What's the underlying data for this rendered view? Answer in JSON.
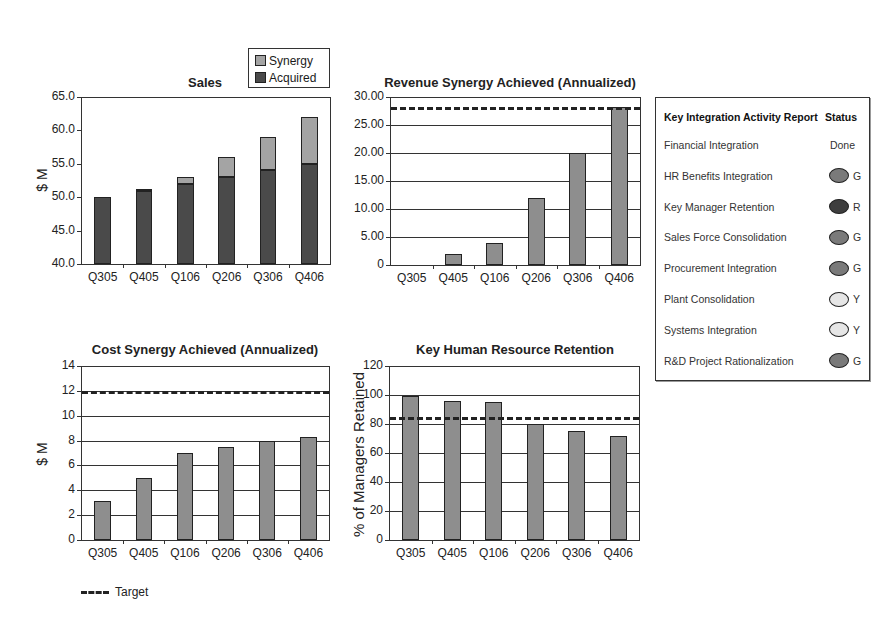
{
  "chart_data": [
    {
      "type": "bar",
      "stacked": true,
      "title": "Sales",
      "xlabel": "",
      "ylabel": "$ M",
      "ylim": [
        40.0,
        65.0
      ],
      "yticks": [
        "65.0",
        "60.0",
        "55.0",
        "50.0",
        "45.0",
        "40.0"
      ],
      "categories": [
        "Q305",
        "Q405",
        "Q106",
        "Q206",
        "Q306",
        "Q406"
      ],
      "series": [
        {
          "name": "Acquired",
          "color": "#4a4a4a",
          "values": [
            50.0,
            51.0,
            52.0,
            53.0,
            54.0,
            55.0
          ]
        },
        {
          "name": "Synergy",
          "color": "#a4a4a4",
          "values": [
            0.0,
            0.3,
            1.0,
            3.0,
            5.0,
            7.0
          ]
        }
      ],
      "legend": [
        "Synergy",
        "Acquired"
      ],
      "legend_position": "top-right",
      "grid": false
    },
    {
      "type": "bar",
      "title": "Revenue Synergy Achieved (Annualized)",
      "xlabel": "",
      "ylabel": "",
      "ylim": [
        0,
        30
      ],
      "yticks": [
        "30.00",
        "25.00",
        "20.00",
        "15.00",
        "10.00",
        "5.00",
        "0"
      ],
      "categories": [
        "Q305",
        "Q405",
        "Q106",
        "Q206",
        "Q306",
        "Q406"
      ],
      "values": [
        0,
        2.0,
        4.0,
        12.0,
        20.0,
        28.3
      ],
      "target": 28.3,
      "grid": true
    },
    {
      "type": "bar",
      "title": "Cost Synergy Achieved (Annualized)",
      "xlabel": "",
      "ylabel": "$ M",
      "ylim": [
        0,
        14
      ],
      "yticks": [
        "14",
        "12",
        "10",
        "8",
        "6",
        "4",
        "2",
        "0"
      ],
      "categories": [
        "Q305",
        "Q405",
        "Q106",
        "Q206",
        "Q306",
        "Q406"
      ],
      "values": [
        3.1,
        5.0,
        7.0,
        7.5,
        8.0,
        8.3
      ],
      "target": 12,
      "grid": true
    },
    {
      "type": "bar",
      "title": "Key Human Resource Retention",
      "xlabel": "",
      "ylabel": "% of Managers Retained",
      "ylim": [
        0,
        120
      ],
      "yticks": [
        "120",
        "100",
        "80",
        "60",
        "40",
        "20",
        "0"
      ],
      "categories": [
        "Q305",
        "Q405",
        "Q106",
        "Q206",
        "Q306",
        "Q406"
      ],
      "values": [
        99,
        96,
        95,
        80,
        75,
        72
      ],
      "target": 85,
      "grid": true
    }
  ],
  "sales": {
    "title": "Sales",
    "ylabel": "$ M",
    "legend": {
      "synergy": "Synergy",
      "acquired": "Acquired"
    }
  },
  "revenue": {
    "title": "Revenue Synergy Achieved (Annualized)"
  },
  "cost": {
    "title": "Cost Synergy Achieved (Annualized)",
    "ylabel": "$ M"
  },
  "retention": {
    "title": "Key Human Resource Retention",
    "ylabel": "% of Managers Retained"
  },
  "target_legend": {
    "label": "Target"
  },
  "status_report": {
    "header": "Key Integration Activity Report",
    "status_header": "Status",
    "items": [
      {
        "label": "Financial Integration",
        "status": "Done",
        "color": ""
      },
      {
        "label": "HR Benefits Integration",
        "status": "G",
        "color": "#7a7a7a"
      },
      {
        "label": "Key Manager Retention",
        "status": "R",
        "color": "#3e3e3e"
      },
      {
        "label": "Sales Force Consolidation",
        "status": "G",
        "color": "#7a7a7a"
      },
      {
        "label": "Procurement Integration",
        "status": "G",
        "color": "#7a7a7a"
      },
      {
        "label": "Plant Consolidation",
        "status": "Y",
        "color": "#e6e6e6"
      },
      {
        "label": "Systems Integration",
        "status": "Y",
        "color": "#e6e6e6"
      },
      {
        "label": "R&D Project Rationalization",
        "status": "G",
        "color": "#7a7a7a"
      }
    ]
  }
}
